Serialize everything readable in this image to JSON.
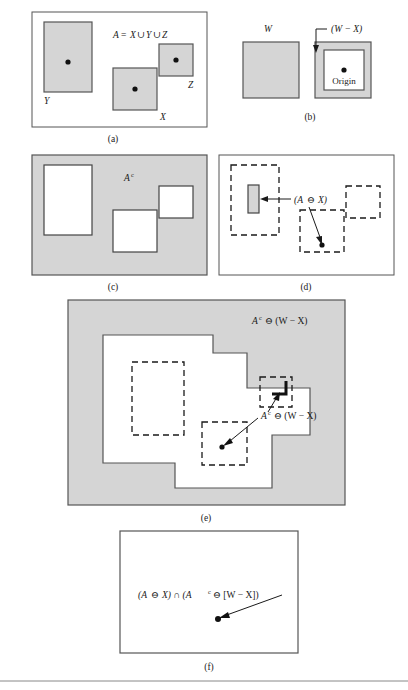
{
  "figure": {
    "background_color": "#ffffff",
    "gray_fill": "#d5d5d5",
    "stroke_color": "#4a4a4a",
    "dark_stroke_color": "#1a1a1a",
    "dot_color": "#111111"
  },
  "panels": [
    {
      "id": "a",
      "caption": "(a)",
      "formula": "A = X ∪ Y ∪ Z",
      "labels": [
        "Y",
        "X",
        "Z"
      ],
      "description": "Set A composed of three shaded rectangles X, Y and Z each with an origin dot"
    },
    {
      "id": "b",
      "caption": "(b)",
      "labels": [
        "W",
        "(W − X)",
        "Origin"
      ],
      "description": "Window W and the frame shaped set (W minus X) with origin dot"
    },
    {
      "id": "c",
      "caption": "(c)",
      "formula": "A",
      "formula_superscript": "c",
      "description": "Complement of A shown as gray background with three white rectangles"
    },
    {
      "id": "d",
      "caption": "(d)",
      "formula_parts": [
        "(A ",
        " X)"
      ],
      "formula_symbol": "⊖",
      "formula_full": "(A ⊖ X)",
      "description": "Erosion of A by X; dashed outlines of original sets with small shaded bar and a point"
    },
    {
      "id": "e",
      "caption": "(e)",
      "formula_full": "A",
      "formula_superscript": "c",
      "formula_tail": " ⊖ (W − X)",
      "label_outer": "Aᶜ ⊖ (W − X)",
      "label_inner": "Aᶜ ⊖ (W − X)",
      "description": "Erosion of A complement by (W minus X); complex polygonal white region on gray"
    },
    {
      "id": "f",
      "caption": "(f)",
      "formula_full": "(A ⊖ X) ∩ (Aᶜ ⊖ [W − X])",
      "description": "Intersection giving a single point, the hit-or-miss result"
    }
  ],
  "math_symbols": {
    "union": "∪",
    "intersection": "∩",
    "erosion": "⊖",
    "minus": "−",
    "complement": "c"
  },
  "text": {
    "panel_a_formula_lhs": "A",
    "panel_a_formula_eq": "=",
    "panel_a_formula_x": "X",
    "panel_a_formula_y": "Y",
    "panel_a_formula_z": "Z",
    "label_Y": "Y",
    "label_X": "X",
    "label_Z": "Z",
    "label_W": "W",
    "label_W_minus_X": "(W − X)",
    "label_origin": "Origin",
    "label_A": "A",
    "label_complement_sup": "c",
    "label_d_open": "(A",
    "label_d_close": "X)",
    "label_e_tail": "⊖ (W − X)",
    "label_f_first": "(A",
    "label_f_mid": "X) ∩ (A",
    "label_f_tail": "⊖ [W − X])",
    "caption_a": "(a)",
    "caption_b": "(b)",
    "caption_c": "(c)",
    "caption_d": "(d)",
    "caption_e": "(e)",
    "caption_f": "(f)"
  }
}
